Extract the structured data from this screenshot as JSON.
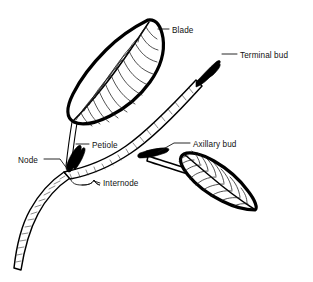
{
  "diagram": {
    "style": "black-and-white line drawing",
    "background_color": "#ffffff",
    "ink_color": "#000000",
    "labels": [
      {
        "id": "blade",
        "text": "Blade",
        "text_x": 172,
        "text_y": 33,
        "points_to": "upper-leaf-apex"
      },
      {
        "id": "terminal-bud",
        "text": "Terminal bud",
        "text_x": 240,
        "text_y": 58,
        "points_to": "stem-tip-bud"
      },
      {
        "id": "petiole",
        "text": "Petiole",
        "text_x": 92,
        "text_y": 148,
        "points_to": "upper-leaf-stalk"
      },
      {
        "id": "axillary-bud",
        "text": "Axillary bud",
        "text_x": 193,
        "text_y": 147,
        "points_to": "lower-leaf-axil"
      },
      {
        "id": "node",
        "text": "Node",
        "text_x": 18,
        "text_y": 163,
        "points_to": "stem-node-junction"
      },
      {
        "id": "internode",
        "text": "Internode",
        "text_x": 103,
        "text_y": 186,
        "points_to": "stem-segment-between-nodes"
      }
    ],
    "parts": {
      "upper_leaf": {
        "name": "upper-leaf-blade",
        "orientation": "apex-upper-right",
        "vein_pairs": 13
      },
      "lower_leaf": {
        "name": "lower-leaf-blade",
        "orientation": "apex-lower-right",
        "vein_pairs": 11
      },
      "main_stem": {
        "name": "main-stem",
        "description": "curves from lower-left upward to terminal bud"
      }
    }
  }
}
